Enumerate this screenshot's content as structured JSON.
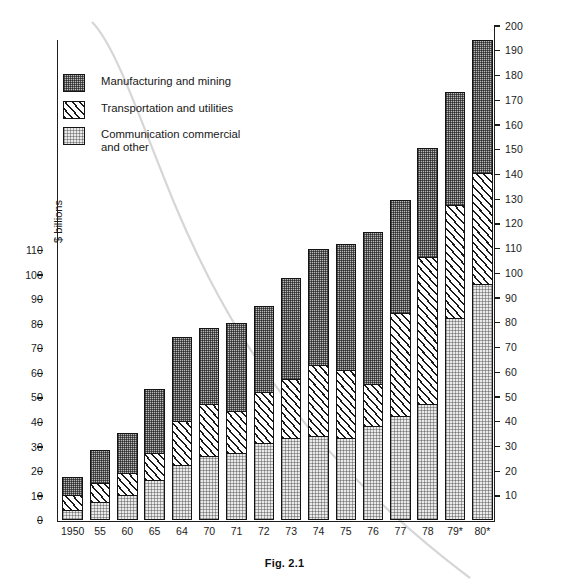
{
  "caption": "Fig. 2.1",
  "axis": {
    "y_title": "$ billions",
    "left_ticks": [
      0,
      10,
      20,
      30,
      40,
      50,
      60,
      70,
      80,
      90,
      100,
      110
    ],
    "right_ticks": [
      10,
      20,
      30,
      40,
      50,
      60,
      70,
      80,
      90,
      100,
      110,
      120,
      130,
      140,
      150,
      160,
      170,
      180,
      190,
      200
    ]
  },
  "legend": {
    "items": [
      {
        "key": "manufacturing",
        "label": "Manufacturing and mining",
        "pattern": "dense-dot",
        "swatch": "#b9b9b9"
      },
      {
        "key": "transportation",
        "label": "Transportation and utilities",
        "pattern": "diagonal-hatch",
        "swatch": "#ffffff"
      },
      {
        "key": "communication",
        "label": "Communication commercial\nand other",
        "pattern": "light-dot",
        "swatch": "#eaeaea"
      }
    ]
  },
  "chart_data": {
    "type": "bar",
    "stacked": true,
    "title": "Fig. 2.1",
    "xlabel": "",
    "ylabel": "$ billions",
    "categories": [
      "1950",
      "55",
      "60",
      "65",
      "64",
      "70",
      "71",
      "72",
      "73",
      "74",
      "75",
      "76",
      "77",
      "78",
      "79*",
      "80*"
    ],
    "series": [
      {
        "name": "Communication commercial and other",
        "values": [
          4,
          7,
          10,
          16,
          22,
          26,
          27,
          31,
          33,
          34,
          33,
          38,
          42,
          47,
          82,
          96
        ]
      },
      {
        "name": "Transportation and utilities",
        "values": [
          6,
          8,
          9,
          11,
          18,
          21,
          17,
          21,
          24,
          29,
          28,
          17,
          42,
          60,
          46,
          45
        ]
      },
      {
        "name": "Manufacturing and mining",
        "values": [
          7,
          13,
          16,
          26,
          34,
          31,
          36,
          35,
          41,
          47,
          51,
          62,
          46,
          44,
          46,
          54
        ]
      }
    ],
    "cumulative_tops": {
      "communication": [
        4,
        7,
        10,
        16,
        22,
        26,
        27,
        31,
        33,
        34,
        33,
        38,
        42,
        47,
        82,
        96
      ],
      "transportation": [
        10,
        15,
        19,
        27,
        40,
        47,
        44,
        52,
        57,
        63,
        61,
        55,
        84,
        107,
        128,
        141
      ],
      "total": [
        17,
        28,
        35,
        53,
        74,
        78,
        80,
        87,
        98,
        110,
        112,
        117,
        130,
        151,
        174,
        195
      ]
    },
    "left_axis_range": [
      0,
      110
    ],
    "right_axis_range": [
      0,
      200
    ],
    "grid": false,
    "legend_position": "inside-top-left"
  }
}
